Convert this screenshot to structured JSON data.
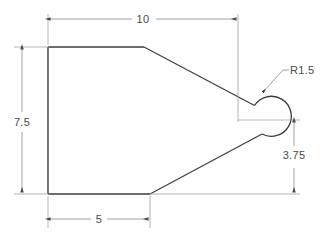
{
  "drawing": {
    "title": "Engineering part outline drawing",
    "type": "2d-orthographic-outline",
    "units_implied": "inches",
    "line_color": "#3b3b3b",
    "dimension_line_color": "#8a8a8a",
    "text_color": "#4a4a4a",
    "background_color": "#fefefe",
    "dimensions": [
      {
        "id": "overall-width",
        "label": "10",
        "value": 10,
        "orientation": "horizontal",
        "position": "top",
        "text_x": 143,
        "text_y": 23
      },
      {
        "id": "overall-height",
        "label": "7.5",
        "value": 7.5,
        "orientation": "vertical",
        "position": "left",
        "text_x": 22,
        "text_y": 126
      },
      {
        "id": "flat-bottom-length",
        "label": "5",
        "value": 5,
        "orientation": "horizontal",
        "position": "bottom",
        "text_x": 99,
        "text_y": 223
      },
      {
        "id": "lower-right-height",
        "label": "3.75",
        "value": 3.75,
        "orientation": "vertical",
        "position": "right",
        "text_x": 294,
        "text_y": 159
      },
      {
        "id": "nose-radius",
        "label": "R1.5",
        "value": 1.5,
        "orientation": "leader",
        "position": "upper-right",
        "text_x": 288,
        "text_y": 74
      }
    ],
    "geometry": {
      "left_edge_x": 48,
      "top_edge_y": 47,
      "bottom_edge_y": 194,
      "top_flat_end_x": 144,
      "bottom_flat_end_x": 150,
      "arc_center_x": 256,
      "arc_center_y": 120,
      "arc_radius": 20,
      "arc_right_x": 276
    }
  }
}
